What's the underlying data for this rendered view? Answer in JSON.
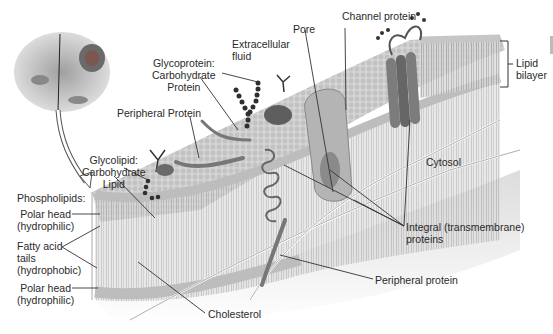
{
  "diagram": {
    "labels": {
      "extracellular": [
        "Extracellular",
        "fluid"
      ],
      "pore": "Pore",
      "channel_protein": "Channel protein",
      "lipid_bilayer": [
        "Lipid",
        "bilayer"
      ],
      "glycoprotein": [
        "Glycoprotein:",
        "Carbohydrate",
        "Protein"
      ],
      "peripheral_protein_top": "Peripheral Protein",
      "glycolipid": [
        "Glycolipid:",
        "Carbohydrate",
        "Lipid"
      ],
      "cytosol": "Cytosol",
      "phospholipids": "Phospholipids:",
      "polar_head_top": [
        "Polar head",
        "(hydrophilic)"
      ],
      "fatty_acid_tails": [
        "Fatty acid",
        "tails",
        "(hydrophobic)"
      ],
      "polar_head_bottom": [
        "Polar head",
        "(hydrophilic)"
      ],
      "integral_proteins": [
        "Integral (transmembrane)",
        "proteins"
      ],
      "peripheral_protein_bottom": "Peripheral protein",
      "cholesterol": "Cholesterol"
    },
    "colors": {
      "membrane_head": "#cfcfcf",
      "membrane_tail": "#b5b5b5",
      "protein": "#7a7a7a",
      "carbohydrate": "#3a3a3a",
      "leader_line": "#333333",
      "cytosol_bg": "#e4e4e4"
    }
  }
}
